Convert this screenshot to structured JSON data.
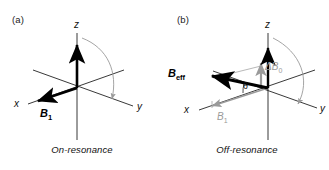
{
  "figure": {
    "background": "#ffffff",
    "axis_color": "#222222",
    "vector_color": "#000000",
    "grey_color": "#9a9a9a",
    "arc_color": "#8c8c8c"
  },
  "panels": [
    {
      "tag": "(a)",
      "caption": "On-resonance",
      "axes": [
        {
          "name": "z",
          "label": "z"
        },
        {
          "name": "x",
          "label": "x"
        },
        {
          "name": "y",
          "label": "y"
        }
      ],
      "vectors": [
        {
          "name": "b1",
          "label": "B",
          "subscript": "1",
          "style": "bold-black",
          "direction": "along -x"
        },
        {
          "name": "bz",
          "label": "",
          "subscript": "",
          "style": "bold-black",
          "direction": "along +z"
        }
      ],
      "rotation_arrow": {
        "name": "magnetization-rotation-arc",
        "style": "grey-curved",
        "from": "z-axis",
        "to": "y-axis"
      }
    },
    {
      "tag": "(b)",
      "caption": "Off-resonance",
      "axes": [
        {
          "name": "z",
          "label": "z"
        },
        {
          "name": "x",
          "label": "x"
        },
        {
          "name": "y",
          "label": "y"
        }
      ],
      "vectors": [
        {
          "name": "beff",
          "label": "B",
          "subscript": "eff",
          "style": "bold-black",
          "direction": "tilted between -x and +z"
        },
        {
          "name": "b1",
          "label": "B",
          "subscript": "1",
          "style": "grey",
          "direction": "along -x"
        },
        {
          "name": "deltab0",
          "label": "ΔB",
          "subscript": "0",
          "style": "grey",
          "direction": "along +z"
        }
      ],
      "angle": {
        "name": "theta-angle",
        "symbol": "θ",
        "between": "B_eff and x-axis"
      },
      "rotation_arrow": {
        "name": "magnetization-rotation-arc",
        "style": "grey-curved",
        "from": "z-axis",
        "to": "y-axis"
      }
    }
  ]
}
